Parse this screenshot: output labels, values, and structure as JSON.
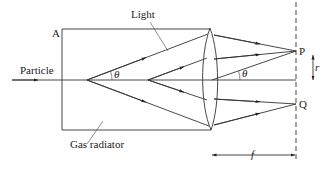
{
  "diagram": {
    "labels": {
      "corner": "A",
      "light": "Light",
      "particle": "Particle",
      "gas_radiator": "Gas radiator",
      "point_p": "P",
      "point_q": "Q",
      "theta_left": "θ",
      "theta_right": "θ",
      "radius": "r",
      "focal_length": "f"
    },
    "colors": {
      "line": "#333333",
      "text": "#222222",
      "background": "#ffffff"
    }
  }
}
